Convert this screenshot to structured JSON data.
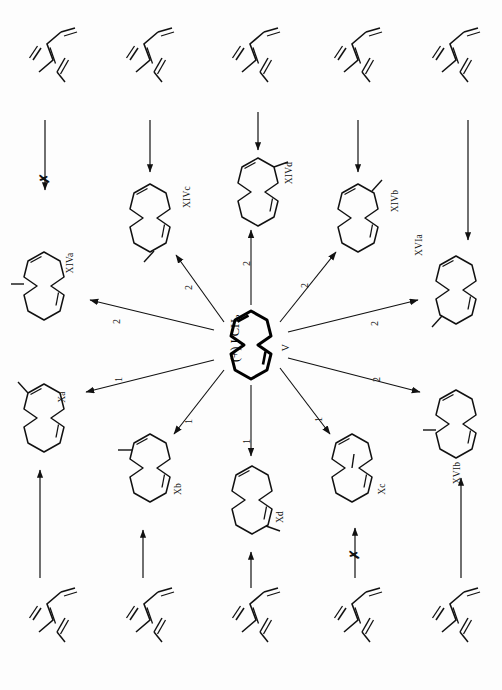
{
  "figure": {
    "orientation": "rotated-90-ccw",
    "center": {
      "label_main": "(+) I CH",
      "label_sub": "2",
      "label_roman": "V",
      "name": "cyclododecatriene-core"
    },
    "edge_labels": {
      "one": "1",
      "two": "2",
      "blocked": "✗"
    },
    "products": [
      {
        "id": "XIVa",
        "label": "XIVa",
        "edge": "2",
        "x": 44,
        "y": 286
      },
      {
        "id": "XIVc",
        "label": "XIVc",
        "edge": "2",
        "x": 150,
        "y": 218
      },
      {
        "id": "XIVd",
        "label": "XIVd",
        "edge": "2",
        "x": 258,
        "y": 192
      },
      {
        "id": "XIVb",
        "label": "XIVb",
        "edge": "2",
        "x": 358,
        "y": 218
      },
      {
        "id": "XVIa",
        "label": "XVIa",
        "edge": "2",
        "x": 456,
        "y": 290
      },
      {
        "id": "Xa",
        "label": "Xa",
        "edge": "1",
        "x": 44,
        "y": 418
      },
      {
        "id": "Xb",
        "label": "Xb",
        "edge": "1",
        "x": 150,
        "y": 468
      },
      {
        "id": "Xd",
        "label": "Xd",
        "edge": "1",
        "x": 252,
        "y": 500
      },
      {
        "id": "Xc",
        "label": "Xc",
        "edge": "1",
        "x": 352,
        "y": 468
      },
      {
        "id": "XVIb",
        "label": "XVIb",
        "edge": "2",
        "x": 456,
        "y": 424
      }
    ],
    "top_precursors": [
      {
        "id": "top-1",
        "x": 55,
        "y": 62,
        "arrow": "blocked",
        "to": "XIVa"
      },
      {
        "id": "top-2",
        "x": 152,
        "y": 62,
        "arrow": "open",
        "to": "XIVc"
      },
      {
        "id": "top-3",
        "x": 258,
        "y": 62,
        "arrow": "open",
        "to": "XIVd"
      },
      {
        "id": "top-4",
        "x": 360,
        "y": 62,
        "arrow": "open",
        "to": "XIVb"
      },
      {
        "id": "top-5",
        "x": 458,
        "y": 62,
        "arrow": "open",
        "to": "XVIa"
      }
    ],
    "bottom_precursors": [
      {
        "id": "bot-1",
        "x": 55,
        "y": 622,
        "arrow": "open",
        "to": "Xa"
      },
      {
        "id": "bot-2",
        "x": 152,
        "y": 622,
        "arrow": "open",
        "to": "Xb"
      },
      {
        "id": "bot-3",
        "x": 258,
        "y": 622,
        "arrow": "open",
        "to": "Xd"
      },
      {
        "id": "bot-4",
        "x": 360,
        "y": 622,
        "arrow": "blocked",
        "to": "Xc"
      },
      {
        "id": "bot-5",
        "x": 458,
        "y": 622,
        "arrow": "open",
        "to": "XVIb"
      }
    ],
    "colors": {
      "ink": "#111111",
      "paper": "#fdfdfd",
      "bold": "#000000"
    }
  }
}
